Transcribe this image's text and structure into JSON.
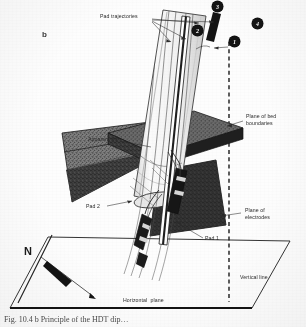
{
  "figure": {
    "panel_letter": "b",
    "caption": "Fig. 10.4   b   Principle of the HDT dip…",
    "compass_label": "N"
  },
  "labels": {
    "pad_trajectories": "Pad trajectories",
    "apparent_dip": "Apparent dip",
    "plane_of_bed_boundaries_line1": "Plane of bed",
    "plane_of_bed_boundaries_line2": "boundaries",
    "plane_of_electrodes_line1": "Plane of",
    "plane_of_electrodes_line2": "electrodes",
    "pad_1": "Pad 1",
    "pad_2": "Pad 2",
    "vertical_line": "Vertical line",
    "horizontal_plane": "Horizontal  plane"
  },
  "pad_markers": [
    {
      "id": "pad-marker-3",
      "number": "3"
    },
    {
      "id": "pad-marker-2",
      "number": "2"
    },
    {
      "id": "pad-marker-1",
      "number": "1"
    },
    {
      "id": "pad-marker-4",
      "number": "4"
    }
  ],
  "colors": {
    "ink": "#141414",
    "paper": "#fdfdfc",
    "label_text": "#2b2b2b",
    "bed_plane_fill": "#555555",
    "electrode_plane_fill": "#2a2a2a",
    "borehole_fill": "#f4f4f2"
  }
}
